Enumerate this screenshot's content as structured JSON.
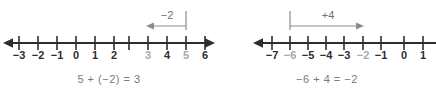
{
  "figure": {
    "background_color": "#ffffff",
    "axis_color": "#2e2e2e",
    "jump_color": "#8c8c8c",
    "label_color": "#2e2e2e",
    "dim_label_color": "#a8a8a8",
    "equation_color": "#7a7a7a"
  },
  "panels": [
    {
      "id": "left",
      "name": "number-line-panel-5-plus-neg2",
      "number_line": {
        "name": "number-line-left",
        "ticks": [
          {
            "value": -3,
            "label": "−3",
            "x": 19,
            "dim": false
          },
          {
            "value": -2,
            "label": "−2",
            "x": 38,
            "dim": false
          },
          {
            "value": -1,
            "label": "−1",
            "x": 57,
            "dim": false
          },
          {
            "value": 0,
            "label": "0",
            "x": 76,
            "dim": false
          },
          {
            "value": 1,
            "label": "1",
            "x": 95,
            "dim": false
          },
          {
            "value": 2,
            "label": "2",
            "x": 114,
            "dim": false
          },
          {
            "value": 3,
            "label": "3",
            "x": 148,
            "dim": true
          },
          {
            "value": 4,
            "label": "4",
            "x": 167,
            "dim": false
          },
          {
            "value": 5,
            "label": "5",
            "x": 186,
            "dim": true
          },
          {
            "value": 6,
            "label": "6",
            "x": 205,
            "dim": false
          }
        ],
        "axis_y": 43,
        "left_end_x": 4,
        "right_end_x": 214,
        "left_arrowhead": true,
        "right_arrowhead": true
      },
      "jump": {
        "name": "jump-arrow-minus-2",
        "label": "−2",
        "label_x": 167,
        "label_y": 9,
        "from_value": 5,
        "to_value": 3,
        "from_x": 186,
        "to_x": 148,
        "arrow_y": 26,
        "stem_top_y": 11,
        "direction": "left"
      },
      "equation": {
        "name": "equation-left",
        "text": "5 + (−2) = 3"
      }
    },
    {
      "id": "right",
      "name": "number-line-panel-neg6-plus-4",
      "number_line": {
        "name": "number-line-right",
        "ticks": [
          {
            "value": -7,
            "label": "−7",
            "x": 54,
            "dim": false
          },
          {
            "value": -6,
            "label": "−6",
            "x": 72,
            "dim": true
          },
          {
            "value": -5,
            "label": "−5",
            "x": 90,
            "dim": false
          },
          {
            "value": -4,
            "label": "−4",
            "x": 108,
            "dim": false
          },
          {
            "value": -3,
            "label": "−3",
            "x": 126,
            "dim": false
          },
          {
            "value": -2,
            "label": "−2",
            "x": 145,
            "dim": true
          },
          {
            "value": -1,
            "label": "−1",
            "x": 163,
            "dim": false
          },
          {
            "value": 0,
            "label": "0",
            "x": 186,
            "dim": false
          },
          {
            "value": 1,
            "label": "1",
            "x": 205,
            "dim": false
          }
        ],
        "axis_y": 43,
        "left_end_x": 36,
        "right_end_x": 218,
        "left_arrowhead": true,
        "right_arrowhead": false
      },
      "jump": {
        "name": "jump-arrow-plus-4",
        "label": "+4",
        "label_x": 110,
        "label_y": 9,
        "from_value": -6,
        "to_value": -2,
        "from_x": 72,
        "to_x": 146,
        "arrow_y": 26,
        "stem_top_y": 11,
        "direction": "right"
      },
      "equation": {
        "name": "equation-right",
        "text": "−6 + 4 = −2"
      }
    }
  ]
}
